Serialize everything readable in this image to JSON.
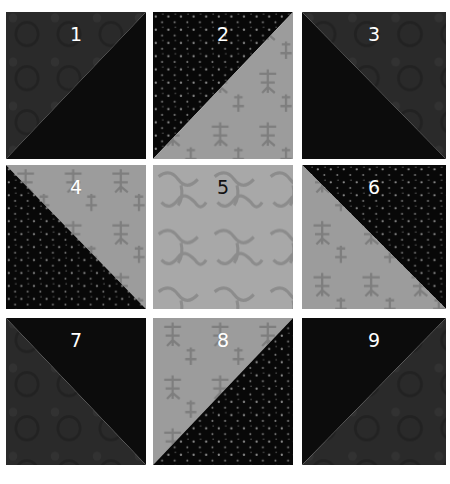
{
  "colors": {
    "background": "#ffffff",
    "dark_mottled": "#2a2a2a",
    "black_solid": "#0c0c0c",
    "black_dotted": "#080808",
    "dot": "#8a8a8a",
    "light_script": "#9c9c9c",
    "light_floral": "#a6a6a6",
    "label_light": "#ffffff",
    "label_dark": "#111111"
  },
  "blocks": [
    {
      "label": "1",
      "type": "half-square-triangle",
      "diagonal": "bottom-left-to-top-right",
      "upper": "dark-mottled",
      "lower": "black-solid"
    },
    {
      "label": "2",
      "type": "half-square-triangle",
      "diagonal": "bottom-left-to-top-right",
      "upper": "black-dotted",
      "lower": "light-script"
    },
    {
      "label": "3",
      "type": "half-square-triangle",
      "diagonal": "top-left-to-bottom-right",
      "upper": "dark-mottled",
      "lower": "black-solid"
    },
    {
      "label": "4",
      "type": "half-square-triangle",
      "diagonal": "top-left-to-bottom-right",
      "upper": "light-script",
      "lower": "black-dotted"
    },
    {
      "label": "5",
      "type": "solid-square",
      "fabric": "light-floral"
    },
    {
      "label": "6",
      "type": "half-square-triangle",
      "diagonal": "top-left-to-bottom-right",
      "upper": "black-dotted",
      "lower": "light-script"
    },
    {
      "label": "7",
      "type": "half-square-triangle",
      "diagonal": "top-left-to-bottom-right",
      "upper": "black-solid",
      "lower": "dark-mottled"
    },
    {
      "label": "8",
      "type": "half-square-triangle",
      "diagonal": "bottom-left-to-top-right",
      "upper": "light-script",
      "lower": "black-dotted"
    },
    {
      "label": "9",
      "type": "half-square-triangle",
      "diagonal": "bottom-left-to-top-right",
      "upper": "black-solid",
      "lower": "dark-mottled"
    }
  ]
}
